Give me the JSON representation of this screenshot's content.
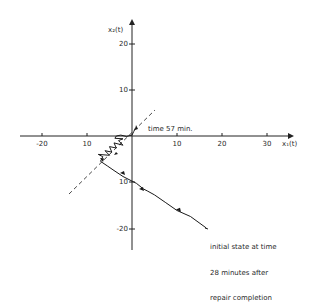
{
  "figure": {
    "type": "phase-plane trajectory",
    "x_axis_label": "x₁(t)",
    "y_axis_label": "x₂(t)",
    "x_ticks": [
      {
        "value": -20,
        "label": "-20"
      },
      {
        "value": -10,
        "label": "10"
      },
      {
        "value": 10,
        "label": "10"
      },
      {
        "value": 20,
        "label": "20"
      },
      {
        "value": 30,
        "label": "30"
      }
    ],
    "y_ticks": [
      {
        "value": 20,
        "label": "20"
      },
      {
        "value": 10,
        "label": "10"
      },
      {
        "value": -10,
        "label": "10"
      },
      {
        "value": -20,
        "label": "-20"
      }
    ],
    "annotations": {
      "end_label": "time 57 min.",
      "start_label_line1": "initial state at time",
      "start_label_line2": "28 minutes after",
      "start_label_line3": "repair completion"
    },
    "colors": {
      "line": "#1a1a1a",
      "axis": "#222222",
      "background": "#ffffff"
    },
    "trajectory": [
      [
        16.5,
        -20
      ],
      [
        13,
        -17.5
      ],
      [
        10,
        -16.2
      ],
      [
        7.5,
        -14.5
      ],
      [
        5,
        -12.8
      ],
      [
        3.5,
        -12
      ],
      [
        2.5,
        -11.5
      ],
      [
        1,
        -10.3
      ],
      [
        0,
        -9.8
      ],
      [
        -2,
        -8.8
      ],
      [
        -4,
        -7.5
      ],
      [
        -5.5,
        -6.5
      ],
      [
        -7,
        -5.5
      ],
      [
        -6.5,
        -4.5
      ],
      [
        -7.5,
        -4
      ],
      [
        -5,
        -4.2
      ],
      [
        -6,
        -3.2
      ],
      [
        -4.5,
        -3.5
      ],
      [
        -5,
        -2.3
      ],
      [
        -3.5,
        -2.6
      ],
      [
        -4,
        -1.5
      ],
      [
        -2,
        -2
      ],
      [
        -3,
        -1
      ],
      [
        -2,
        -0.6
      ],
      [
        -3.8,
        -0.5
      ],
      [
        -3.5,
        0
      ],
      [
        -2.5,
        0.2
      ],
      [
        -1.2,
        -0.1
      ],
      [
        -0.5,
        0.1
      ],
      [
        0,
        0.2
      ],
      [
        0.4,
        1
      ],
      [
        0.8,
        1.8
      ]
    ],
    "dashed_line": [
      [
        -14,
        -13
      ],
      [
        5,
        5.5
      ]
    ]
  }
}
